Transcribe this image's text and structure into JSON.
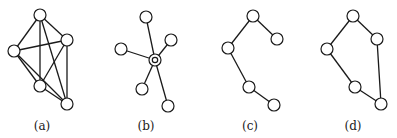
{
  "figure": {
    "node_radius": 6,
    "graphs": [
      {
        "label": "(a)",
        "label_pos": [
          42,
          130
        ],
        "nodes": [
          [
            40,
            15
          ],
          [
            67,
            40
          ],
          [
            14,
            51
          ],
          [
            40,
            86
          ],
          [
            67,
            104
          ]
        ],
        "edges": [
          [
            0,
            1
          ],
          [
            0,
            2
          ],
          [
            0,
            3
          ],
          [
            0,
            4
          ],
          [
            1,
            2
          ],
          [
            1,
            3
          ],
          [
            1,
            4
          ],
          [
            2,
            3
          ],
          [
            2,
            4
          ],
          [
            3,
            4
          ]
        ],
        "center": null
      },
      {
        "label": "(b)",
        "label_pos": [
          146,
          130
        ],
        "nodes": [
          [
            155,
            60
          ],
          [
            146,
            17
          ],
          [
            171,
            40
          ],
          [
            121,
            49
          ],
          [
            142,
            89
          ],
          [
            168,
            106
          ]
        ],
        "edges": [
          [
            0,
            1
          ],
          [
            0,
            2
          ],
          [
            0,
            3
          ],
          [
            0,
            4
          ],
          [
            0,
            5
          ]
        ],
        "center": 0
      },
      {
        "label": "(c)",
        "label_pos": [
          250,
          130
        ],
        "nodes": [
          [
            253,
            16
          ],
          [
            277,
            39
          ],
          [
            228,
            48
          ],
          [
            249,
            87
          ],
          [
            274,
            105
          ]
        ],
        "edges": [
          [
            0,
            1
          ],
          [
            0,
            2
          ],
          [
            2,
            3
          ],
          [
            3,
            4
          ]
        ],
        "center": null
      },
      {
        "label": "(d)",
        "label_pos": [
          353,
          130
        ],
        "nodes": [
          [
            353,
            16
          ],
          [
            377,
            39
          ],
          [
            327,
            49
          ],
          [
            355,
            87
          ],
          [
            381,
            104
          ]
        ],
        "edges": [
          [
            0,
            1
          ],
          [
            0,
            2
          ],
          [
            2,
            3
          ],
          [
            3,
            4
          ],
          [
            1,
            4
          ]
        ],
        "center": null
      }
    ]
  }
}
